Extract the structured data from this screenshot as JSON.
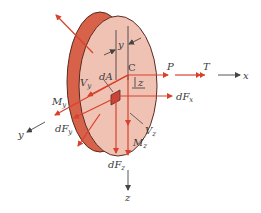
{
  "diagram": {
    "colors": {
      "rim": "#d8614a",
      "face": "#f0c2b4",
      "outline": "#5a2a22",
      "force": "#d8412c",
      "axis": "#444444",
      "text": "#3a3a3a"
    },
    "labels": {
      "y_dim": "y",
      "dA": "dA",
      "C": "C",
      "z_dim": "z",
      "P": "P",
      "T": "T",
      "x_axis": "x",
      "dFx": {
        "main": "dF",
        "sub": "x"
      },
      "Vy": {
        "main": "V",
        "sub": "y"
      },
      "My": {
        "main": "M",
        "sub": "y"
      },
      "dFy": {
        "main": "dF",
        "sub": "y"
      },
      "y_axis": "y",
      "Vz": {
        "main": "V",
        "sub": "z"
      },
      "Mz": {
        "main": "M",
        "sub": "z"
      },
      "dFz": {
        "main": "dF",
        "sub": "z"
      },
      "z_axis": "z"
    }
  }
}
